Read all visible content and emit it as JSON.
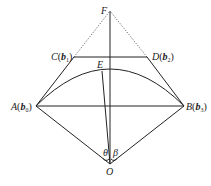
{
  "diagram": {
    "points": {
      "F": {
        "label": "F",
        "x": 110,
        "y": 11
      },
      "C": {
        "label": "C",
        "vec": "b",
        "sub": "1",
        "x": 74,
        "y": 57
      },
      "D": {
        "label": "D",
        "vec": "b",
        "sub": "2",
        "x": 147,
        "y": 57
      },
      "E": {
        "label": "E",
        "x": 102,
        "y": 70
      },
      "A": {
        "label": "A",
        "vec": "b",
        "sub": "0",
        "x": 36,
        "y": 106
      },
      "B": {
        "label": "B",
        "vec": "b",
        "sub": "3",
        "x": 184,
        "y": 106
      },
      "O": {
        "label": "O",
        "x": 110,
        "y": 164
      }
    },
    "angles": {
      "theta": "θ",
      "beta": "β"
    },
    "paren_open": "(",
    "paren_close": ")",
    "edges_solid": [
      "AC",
      "DB",
      "CD",
      "AB",
      "OA",
      "OB",
      "OF",
      "OE",
      "arc AEB"
    ],
    "edges_dotted": [
      "CF",
      "DF"
    ],
    "colors": {
      "line": "#222222",
      "background": "#ffffff"
    }
  }
}
